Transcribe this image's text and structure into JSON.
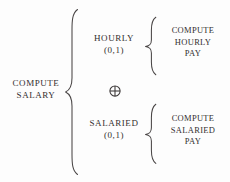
{
  "diagram": {
    "type": "structure-chart",
    "notation": "Warnier-Orr",
    "background_color": "#fdfdfd",
    "ink_color": "#332f2f",
    "root": {
      "label_line1": "COMPUTE",
      "label_line2": "SALARY"
    },
    "operator": {
      "symbol": "⊕",
      "name": "exclusive-or",
      "glyph": "circled-plus"
    },
    "branches": [
      {
        "condition_label": "HOURLY",
        "occurrence": "(0,1)",
        "action_line1": "COMPUTE",
        "action_line2": "HOURLY",
        "action_line3": "PAY"
      },
      {
        "condition_label": "SALARIED",
        "occurrence": "(0,1)",
        "action_line1": "COMPUTE",
        "action_line2": "SALARIED",
        "action_line3": "PAY"
      }
    ]
  }
}
